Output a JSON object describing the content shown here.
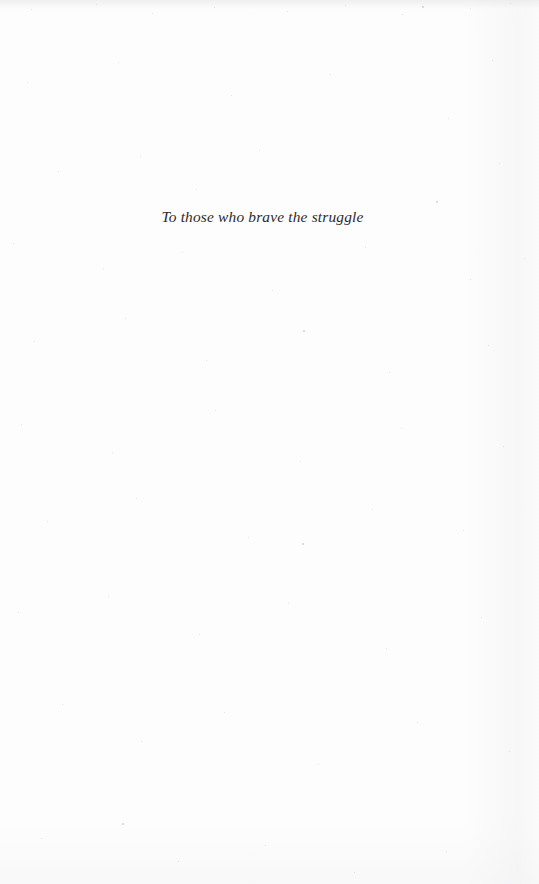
{
  "page": {
    "kind": "book-dedication-page",
    "background_color": "#fdfdfd",
    "width": 539,
    "height": 884
  },
  "dedication": {
    "text": "To those who brave the struggle",
    "style": "italic",
    "color": "#2b2b2b",
    "alignment": "center"
  }
}
